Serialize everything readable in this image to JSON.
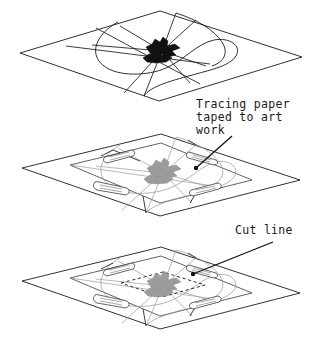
{
  "figure": {
    "background_color": "#ffffff",
    "ink_color": "#1a1a1a",
    "faint_ink_color": "#9a9a9a",
    "artwork_dark_color": "#111111",
    "artwork_gray_color": "#9c9c9c",
    "width": 319,
    "height": 337
  },
  "annotations": [
    {
      "id": "tracing-paper-note",
      "lines": [
        "Tracing paper",
        "taped to art",
        "work"
      ],
      "line1": "Tracing paper",
      "line2": "taped to art",
      "line3": "work",
      "text_x": 196,
      "text_y": 108,
      "leader_from_x": 232,
      "leader_from_y": 136,
      "leader_to_x": 196,
      "leader_to_y": 168,
      "has_end_dot": true
    },
    {
      "id": "cut-line-note",
      "lines": [
        "Cut line"
      ],
      "line1": "Cut line",
      "text_x": 235,
      "text_y": 234,
      "leader_from_x": 273,
      "leader_from_y": 242,
      "leader_to_x": 193,
      "leader_to_y": 274,
      "has_end_dot": true
    }
  ],
  "panels": [
    {
      "id": "panel-top",
      "order": 1,
      "caption": "Original art work with radiating layout lines",
      "center_x": 161,
      "center_y": 53,
      "has_base_sheet": true,
      "has_overlay_sheet": false,
      "has_tape": false,
      "has_cut_line": false,
      "artwork_tone": "dark"
    },
    {
      "id": "panel-middle",
      "order": 2,
      "caption": "Tracing paper taped over art work",
      "center_x": 161,
      "center_y": 176,
      "has_base_sheet": true,
      "has_overlay_sheet": true,
      "has_tape": true,
      "tape_count": 4,
      "has_cut_line": false,
      "artwork_tone": "gray"
    },
    {
      "id": "panel-bottom",
      "order": 3,
      "caption": "Cut line marked on the tracing paper",
      "center_x": 161,
      "center_y": 289,
      "has_base_sheet": true,
      "has_overlay_sheet": true,
      "has_tape": true,
      "tape_count": 4,
      "has_cut_line": true,
      "artwork_tone": "gray"
    }
  ]
}
